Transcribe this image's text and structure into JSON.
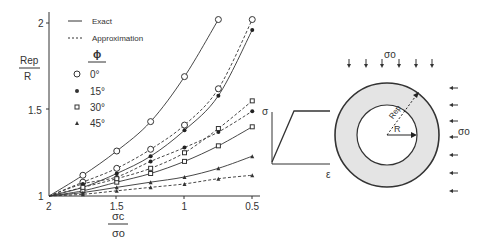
{
  "chart_data": {
    "type": "line",
    "title": "",
    "xlabel_num": "σc",
    "xlabel_den": "σo",
    "ylabel_num": "Rep",
    "ylabel_den": "R",
    "xlim": [
      2,
      0.5
    ],
    "ylim": [
      1,
      2
    ],
    "x_ticks": [
      "2",
      "1.5",
      "1",
      "0.5"
    ],
    "y_ticks": [
      "1",
      "1.5",
      "2"
    ],
    "legend": {
      "exact": "Exact",
      "approx": "Approximation",
      "phi_label": "ϕ",
      "angles": [
        "0°",
        "15°",
        "30°",
        "45°"
      ]
    },
    "x": [
      2.0,
      1.75,
      1.5,
      1.25,
      1.0,
      0.75,
      0.5
    ],
    "series": [
      {
        "name": "0° Exact",
        "style": "solid",
        "marker": "circle-open",
        "values": [
          1.0,
          1.12,
          1.26,
          1.43,
          1.69,
          2.02,
          null
        ]
      },
      {
        "name": "0° Approximation",
        "style": "dashed",
        "marker": "circle-open",
        "values": [
          1.0,
          1.08,
          1.16,
          1.27,
          1.41,
          1.62,
          2.02
        ]
      },
      {
        "name": "15° Exact",
        "style": "solid",
        "marker": "dot",
        "values": [
          1.0,
          1.05,
          1.13,
          1.23,
          1.38,
          1.58,
          1.96
        ]
      },
      {
        "name": "15° Approximation",
        "style": "dashed",
        "marker": "dot",
        "values": [
          1.0,
          1.07,
          1.11,
          1.2,
          1.28,
          1.37,
          1.49
        ]
      },
      {
        "name": "30° Exact",
        "style": "solid",
        "marker": "square-open",
        "values": [
          1.0,
          1.03,
          1.08,
          1.13,
          1.2,
          1.29,
          1.4
        ]
      },
      {
        "name": "30° Approximation",
        "style": "dashed",
        "marker": "square-open",
        "values": [
          1.0,
          1.05,
          1.1,
          1.16,
          1.25,
          1.39,
          1.55
        ]
      },
      {
        "name": "45° Exact",
        "style": "solid",
        "marker": "triangle",
        "values": [
          1.0,
          1.02,
          1.05,
          1.08,
          1.11,
          1.16,
          1.23
        ]
      },
      {
        "name": "45° Approximation",
        "style": "dashed",
        "marker": "triangle",
        "values": [
          1.0,
          1.01,
          1.03,
          1.05,
          1.07,
          1.1,
          1.12
        ]
      }
    ],
    "grid": false,
    "legend_position": "upper-left"
  },
  "diagram": {
    "stress_strain": {
      "y_label": "σ",
      "x_label": "ε"
    },
    "tunnel": {
      "inner_label": "R",
      "outer_label": "Rep",
      "top_stress": "σo",
      "side_stress": "σo"
    }
  }
}
